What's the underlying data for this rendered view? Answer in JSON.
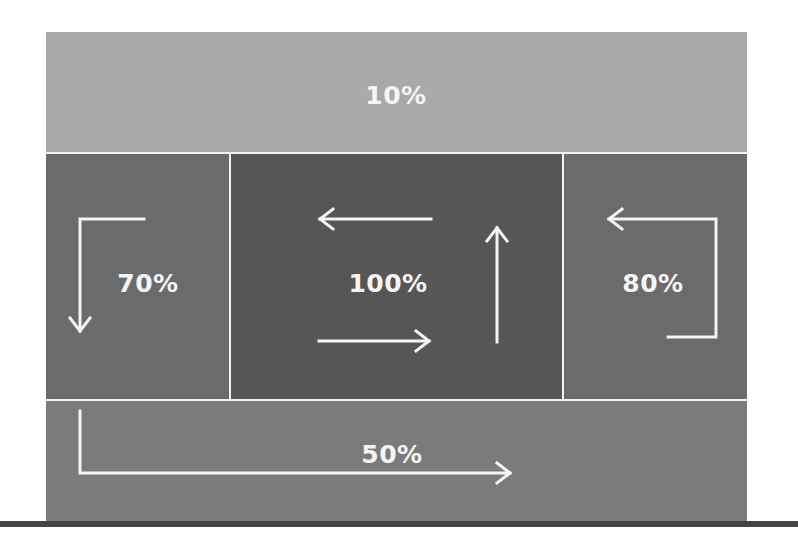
{
  "diagram": {
    "colors": {
      "background": "#ffffff",
      "divider": "#f2f2f2",
      "arrow": "#f4f4f4",
      "floor": "#444444"
    },
    "zones": {
      "top": {
        "label": "10%",
        "color": "#a9a9a9"
      },
      "left": {
        "label": "70%",
        "color": "#6b6b6b"
      },
      "center": {
        "label": "100%",
        "color": "#565656"
      },
      "right": {
        "label": "80%",
        "color": "#6b6b6b"
      },
      "bottom": {
        "label": "50%",
        "color": "#7b7b7b"
      }
    },
    "arrows": [
      {
        "id": "left-down-arrow",
        "direction": "down",
        "zone": "left"
      },
      {
        "id": "center-top-left-arrow",
        "direction": "left",
        "zone": "center"
      },
      {
        "id": "center-bottom-right-arrow",
        "direction": "right",
        "zone": "center"
      },
      {
        "id": "center-up-arrow",
        "direction": "up",
        "zone": "center"
      },
      {
        "id": "right-loop-left-arrow",
        "direction": "left",
        "zone": "right"
      },
      {
        "id": "bottom-right-arrow",
        "direction": "right",
        "zone": "bottom"
      }
    ]
  }
}
